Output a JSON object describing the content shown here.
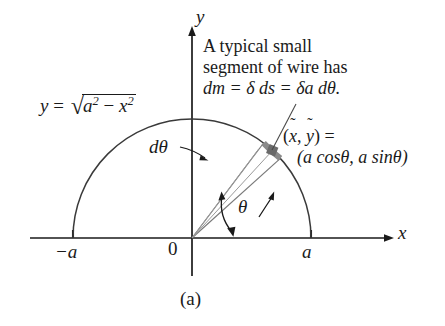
{
  "figure": {
    "caption": "(a)",
    "axes": {
      "x_label": "x",
      "y_label": "y",
      "origin_label": "0",
      "tick_left_label": "−a",
      "tick_right_label": "a"
    },
    "curve_equation": {
      "lhs": "y",
      "equals": "=",
      "radicand_base": "a",
      "radicand_exp": "2",
      "minus": "−",
      "radicand_base2": "x",
      "radicand_exp2": "2",
      "radical_glyph": "√",
      "full_text": "y = √(a² − x²)"
    },
    "annotation_note": {
      "line1": "A typical small",
      "line2": "segment of wire has",
      "line3": "dm = δ ds = δa dθ."
    },
    "annotation_point": {
      "line1_prefix": "(",
      "line1_var1": "x",
      "line1_sep": ", ",
      "line1_var2": "y",
      "line1_suffix": ") =",
      "line2": "(a cosθ, a sinθ)",
      "tilde": "˜"
    },
    "label_dtheta": "dθ",
    "label_theta": "θ",
    "colors": {
      "ink": "#1a1a1a",
      "curve": "#3a3a3a",
      "wedge_ray": "#6e6e6e",
      "segment_gray": "#8a8a8a",
      "segment_dot": "#6a6a6a",
      "background": "#ffffff"
    },
    "geometry": {
      "origin_x": 192,
      "origin_y": 238,
      "radius": 119,
      "wedge_angle_start_deg": 42,
      "wedge_angle_end_deg": 53
    }
  }
}
